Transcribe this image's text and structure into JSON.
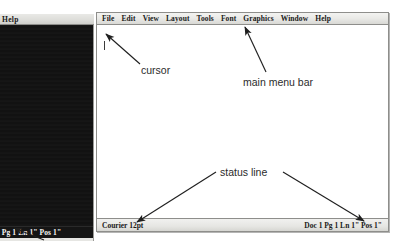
{
  "background_window": {
    "title": "Help",
    "status_text": "1 Pg 1 Ln 1\" Pos 1\""
  },
  "app_window": {
    "menubar": {
      "items": [
        {
          "label": "File",
          "hotkey": "F"
        },
        {
          "label": "Edit",
          "hotkey": "Ed"
        },
        {
          "label": "View",
          "hotkey": "V"
        },
        {
          "label": "Layout",
          "hotkey": "L"
        },
        {
          "label": "Tools",
          "hotkey": "T"
        },
        {
          "label": "Font",
          "hotkey": "Fo"
        },
        {
          "label": "Graphics",
          "hotkey": "G"
        },
        {
          "label": "Window",
          "hotkey": "W"
        },
        {
          "label": "Help",
          "hotkey": "H"
        }
      ]
    },
    "document": {
      "content": "",
      "cursor_visible": true
    },
    "statusbar": {
      "left": "Courier 12pt",
      "right": "Doc 1 Pg 1 Ln 1\" Pos 1\""
    }
  },
  "annotations": [
    {
      "id": "cursor",
      "label": "cursor"
    },
    {
      "id": "menubar",
      "label": "main menu bar"
    },
    {
      "id": "status",
      "label": "status line"
    }
  ],
  "colors": {
    "window_bg": "#ffffff",
    "chrome": "#e9e9e6",
    "border": "#8e8e8b",
    "dark_panel": "#121212",
    "text": "#1a1a1a",
    "annotation_text": "#2b2b2b"
  }
}
